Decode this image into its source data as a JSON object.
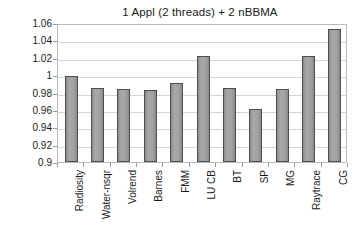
{
  "chart_data": {
    "type": "bar",
    "title": "1 Appl (2 threads) + 2 nBBMA",
    "xlabel": "",
    "ylabel": "Slowdown",
    "categories": [
      "Radiosity",
      "Water-nsqr",
      "Volrend",
      "Barnes",
      "FMM",
      "LU CB",
      "BT",
      "SP",
      "MG",
      "Raytrace",
      "CG"
    ],
    "values": [
      0.999,
      0.985,
      0.984,
      0.983,
      0.991,
      1.022,
      0.985,
      0.961,
      0.984,
      1.022,
      1.053
    ],
    "ylim": [
      0.9,
      1.06
    ],
    "ytick_labels": [
      "1.06",
      "1.04",
      "1.02",
      "1",
      "0.98",
      "0.96",
      "0.94",
      "0.92",
      "0.9"
    ],
    "ytick_values": [
      1.06,
      1.04,
      1.02,
      1.0,
      0.98,
      0.96,
      0.94,
      0.92,
      0.9
    ],
    "grid": true,
    "legend": null,
    "bar_color": "#9e9e9e",
    "bar_edge_color": "#4d4d4d",
    "grid_color": "#d6d6d6",
    "frame_color": "#b9b9b9",
    "text_color": "#1a1a1a"
  }
}
